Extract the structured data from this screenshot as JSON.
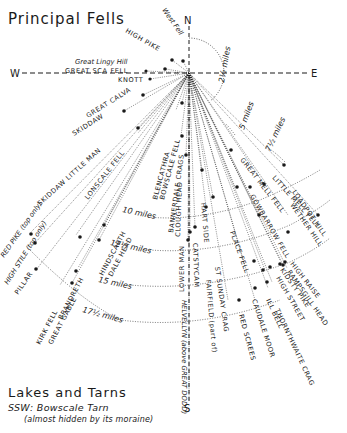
{
  "header": {
    "title": "Principal Fells"
  },
  "compass": {
    "north": "N",
    "south": "S",
    "east": "E",
    "west": "W"
  },
  "distances": [
    {
      "label": "2½ miles"
    },
    {
      "label": "5 miles"
    },
    {
      "label": "7½ miles"
    },
    {
      "label": "10 miles"
    },
    {
      "label": "12½ miles"
    },
    {
      "label": "15 miles"
    },
    {
      "label": "17½ miles"
    }
  ],
  "fells": [
    {
      "name": "West Fell"
    },
    {
      "name": "HIGH PIKE"
    },
    {
      "name": "Great Lingy Hill"
    },
    {
      "name": "GREAT SCA FELL"
    },
    {
      "name": "KNOTT"
    },
    {
      "name": "GREAT CALVA"
    },
    {
      "name": "SKIDDAW"
    },
    {
      "name": "SKIDDAW LITTLE MAN"
    },
    {
      "name": "LONSCALE FELL"
    },
    {
      "name": "BLENCATHRA"
    },
    {
      "name": "BOWSCALE FELL"
    },
    {
      "name": "BANNERDALE CRAGS"
    },
    {
      "name": "CLOUGH HEAD"
    },
    {
      "name": "HART SIDE"
    },
    {
      "name": "ST SUNDAY CRAG"
    },
    {
      "name": "FAIRFIELD (part of)"
    },
    {
      "name": "CATSTYCAM"
    },
    {
      "name": "HELVELLYN"
    },
    {
      "name": "LOWER MAN"
    },
    {
      "name": "HELVELLYN (above GREAT DODD)"
    },
    {
      "name": "RED SCREES"
    },
    {
      "name": "PLACE FELL"
    },
    {
      "name": "CAUDALE MOOR"
    },
    {
      "name": "ILL BELL"
    },
    {
      "name": "THORNTHWAITE CRAG"
    },
    {
      "name": "HIGH STREET"
    },
    {
      "name": "KIDSTY PIKE"
    },
    {
      "name": "RAMPSGILL HEAD"
    },
    {
      "name": "HIGH RAISE"
    },
    {
      "name": "WETHER HILL"
    },
    {
      "name": "LOADPOT HILL"
    },
    {
      "name": "GOWBARROW FELL"
    },
    {
      "name": "GREAT MELL FELL"
    },
    {
      "name": "LITTLE MELL FELL"
    },
    {
      "name": "HINDSCARTH"
    },
    {
      "name": "DALE HEAD"
    },
    {
      "name": "PILLAR"
    },
    {
      "name": "KIRK FELL"
    },
    {
      "name": "GREAT GABLE"
    },
    {
      "name": "BRANDRETH"
    },
    {
      "name": "RED PIKE (top only)"
    },
    {
      "name": "HIGH STILE (top only)"
    }
  ],
  "lakes": {
    "title": "Lakes and Tarns",
    "direction": "SSW:",
    "name": "Bowscale Tarn",
    "note": "(almost hidden by its moraine)"
  },
  "colors": {
    "ink": "#1a1a1a",
    "paper": "#ffffff"
  }
}
